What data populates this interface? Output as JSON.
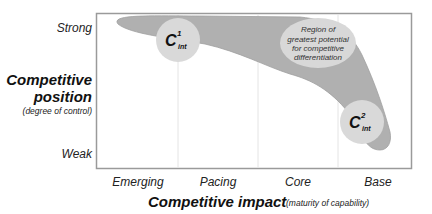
{
  "y_axis": {
    "title_line1": "Competitive",
    "title_line2": "position",
    "subtitle": "(degree of control)",
    "ticks": {
      "top": "Strong",
      "bottom": "Weak"
    }
  },
  "x_axis": {
    "title": "Competitive impact",
    "subtitle": "(maturity of capability)",
    "ticks": [
      "Emerging",
      "Pacing",
      "Core",
      "Base"
    ]
  },
  "band": {
    "label_lines": [
      "Region of",
      "greatest potential",
      "for competitive",
      "differentiation"
    ],
    "fill_color": "#b0b0b0",
    "label_ellipse_color": "#d8d8d8"
  },
  "markers": [
    {
      "base": "C",
      "sup": "1",
      "sub": "int",
      "color": "#d9d9d9"
    },
    {
      "base": "C",
      "sup": "2",
      "sub": "int",
      "color": "#d9d9d9"
    }
  ],
  "colors": {
    "frame": "#9a9a9a",
    "gridline": "#e4e4e4"
  }
}
